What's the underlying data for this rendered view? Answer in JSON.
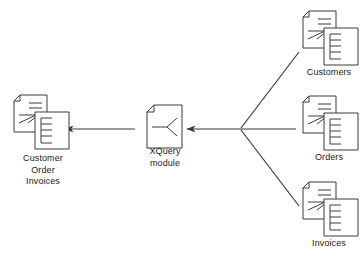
{
  "diagram": {
    "stroke_color": "#3a3a3a",
    "fill_color": "#ffffff",
    "text_color": "#1a1a1a",
    "nodes": [
      {
        "id": "output",
        "label": "Customer\nOrder\nInvoices",
        "icon": "stacked-documents-icon",
        "role": "output"
      },
      {
        "id": "xquery",
        "label": "XQuery\nmodule",
        "icon": "xquery-module-document-icon",
        "role": "process"
      },
      {
        "id": "customers",
        "label": "Customers",
        "icon": "stacked-documents-icon",
        "role": "input"
      },
      {
        "id": "orders",
        "label": "Orders",
        "icon": "stacked-documents-icon",
        "role": "input"
      },
      {
        "id": "invoices",
        "label": "Invoices",
        "icon": "stacked-documents-icon",
        "role": "input"
      }
    ],
    "edges": [
      {
        "id": "customers-to-junction",
        "from": "customers",
        "to": "junction",
        "arrowhead": false
      },
      {
        "id": "orders-to-junction",
        "from": "orders",
        "to": "junction",
        "arrowhead": false
      },
      {
        "id": "invoices-to-junction",
        "from": "invoices",
        "to": "junction",
        "arrowhead": false
      },
      {
        "id": "junction-to-xquery",
        "from": "junction",
        "to": "xquery",
        "arrowhead": true
      },
      {
        "id": "xquery-to-output",
        "from": "xquery",
        "to": "output",
        "arrowhead": true
      }
    ]
  }
}
